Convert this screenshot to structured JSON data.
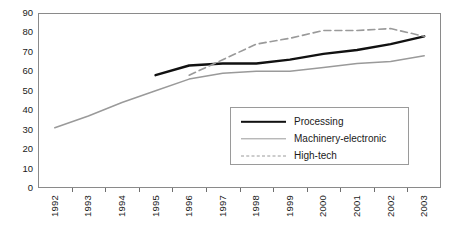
{
  "chart_data": {
    "type": "line",
    "title": "",
    "xlabel": "",
    "ylabel": "",
    "ylim": [
      0,
      90
    ],
    "ytick_step": 10,
    "grid": false,
    "legend_position": "inside-bottom-right",
    "categories": [
      "1992",
      "1993",
      "1994",
      "1995",
      "1996",
      "1997",
      "1998",
      "1999",
      "2000",
      "2001",
      "2002",
      "2003"
    ],
    "yticks": [
      "0",
      "10",
      "20",
      "30",
      "40",
      "50",
      "60",
      "70",
      "80",
      "90"
    ],
    "series": [
      {
        "name": "Processing",
        "style": "solid",
        "color": "#111111",
        "width": 2.4,
        "values": [
          null,
          null,
          null,
          58,
          63,
          64,
          64,
          66,
          69,
          71,
          74,
          78
        ]
      },
      {
        "name": "Machinery-electronic",
        "style": "solid",
        "color": "#9a9a9a",
        "width": 1.5,
        "values": [
          31,
          37,
          44,
          50,
          56,
          59,
          60,
          60,
          62,
          64,
          65,
          68
        ]
      },
      {
        "name": "High-tech",
        "style": "dashed",
        "color": "#9a9a9a",
        "width": 1.6,
        "values": [
          null,
          null,
          null,
          null,
          58,
          66,
          74,
          77,
          81,
          81,
          82,
          78
        ]
      }
    ]
  },
  "legend": {
    "items": [
      {
        "label": "Processing"
      },
      {
        "label": "Machinery-electronic"
      },
      {
        "label": "High-tech"
      }
    ]
  }
}
